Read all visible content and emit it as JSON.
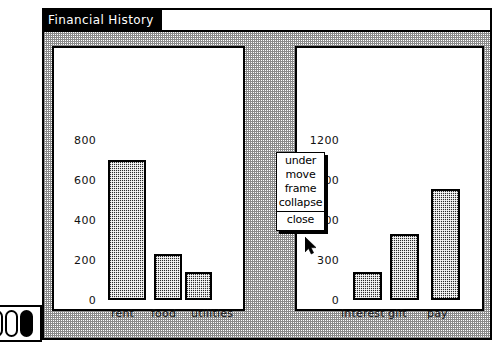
{
  "window": {
    "title": "Financial History",
    "accent_color": "#2a2a6a",
    "titlebar_bg": "#000000",
    "titlebar_fg": "#ffffff"
  },
  "dock": {
    "items": [
      {
        "name": "dock-pill-1",
        "state": "inactive"
      },
      {
        "name": "dock-pill-2",
        "state": "inactive"
      },
      {
        "name": "dock-pill-3",
        "state": "active"
      }
    ]
  },
  "popup_menu": {
    "items": [
      "under",
      "move",
      "frame",
      "collapse"
    ],
    "close_label": "close"
  },
  "cursor": {
    "kind": "arrow-pointer",
    "x": 265,
    "y": 212
  },
  "chart_data": [
    {
      "type": "bar",
      "id": "expenses",
      "title": "",
      "xlabel": "",
      "ylabel": "",
      "categories": [
        "rent",
        "food",
        "utilities"
      ],
      "values": [
        700,
        230,
        140
      ],
      "yticks": [
        0,
        200,
        400,
        600,
        800
      ],
      "ylim": [
        0,
        840
      ],
      "grid": false,
      "legend": "none",
      "bar_fill": "dither-50",
      "bar_border": "#000000"
    },
    {
      "type": "bar",
      "id": "income",
      "title": "",
      "xlabel": "",
      "ylabel": "",
      "categories": [
        "interest",
        "gift",
        "pay"
      ],
      "values": [
        210,
        495,
        830
      ],
      "yticks": [
        0,
        300,
        600,
        900,
        1200
      ],
      "ylim": [
        0,
        1260
      ],
      "grid": false,
      "legend": "none",
      "bar_fill": "dither-50",
      "bar_border": "#000000"
    }
  ]
}
